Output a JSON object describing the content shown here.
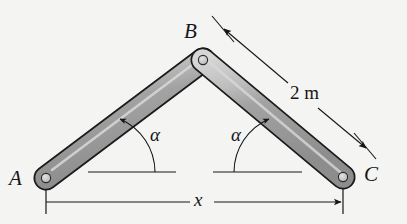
{
  "figure": {
    "background_color": "#f4f4f2",
    "ink_color": "#15161a",
    "link_fill_color": "#9a9a9a",
    "link_highlight_color": "#cccccc",
    "link_outline_color": "#1b1b1b",
    "pin_fill_color": "#c9c9c9"
  },
  "labels": {
    "point_a": "A",
    "point_b": "B",
    "point_c": "C",
    "alpha_left": "α",
    "alpha_right": "α",
    "link_length": "2 m",
    "span": "x"
  },
  "joints": [
    {
      "name": "A",
      "label": "A",
      "x": 46,
      "y": 178,
      "type": "pin"
    },
    {
      "name": "B",
      "label": "B",
      "x": 203,
      "y": 60,
      "type": "pin"
    },
    {
      "name": "C",
      "label": "C",
      "x": 343,
      "y": 177,
      "type": "pin"
    }
  ],
  "links": [
    {
      "name": "link-ab",
      "from": "A",
      "to": "B",
      "length_label": "2 m"
    },
    {
      "name": "link-bc",
      "from": "B",
      "to": "C",
      "length_label": "2 m"
    }
  ],
  "dimensions": [
    {
      "name": "link-length-dimension",
      "label": "2 m",
      "measures": "link-bc",
      "style": "aligned-double-arrow"
    },
    {
      "name": "span-dimension",
      "label": "x",
      "measures": "horizontal distance A to C",
      "style": "horizontal-with-extension-ticks"
    }
  ],
  "angles": [
    {
      "name": "angle-alpha-left",
      "label": "α",
      "vertex": "A-side datum",
      "between": "horizontal datum and link-ab"
    },
    {
      "name": "angle-alpha-right",
      "label": "α",
      "vertex": "C-side datum",
      "between": "horizontal datum and link-bc"
    }
  ],
  "datum_lines": [
    {
      "name": "datum-left",
      "x1": 88,
      "x2": 176,
      "y": 172
    },
    {
      "name": "datum-right",
      "x1": 213,
      "x2": 302,
      "y": 172
    }
  ]
}
